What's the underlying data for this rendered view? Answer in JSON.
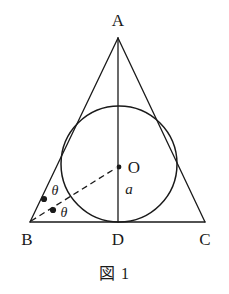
{
  "figure": {
    "caption": "図 1",
    "background_color": "#ffffff",
    "stroke_color": "#1a1a1a",
    "width": 229,
    "height": 294
  },
  "labels": {
    "apex": "A",
    "bottom_left": "B",
    "bottom_right": "C",
    "foot": "D",
    "center": "O",
    "radius": "a",
    "angle_upper": "θ",
    "angle_lower": "θ"
  },
  "geometry": {
    "type": "isosceles-triangle-with-inscribed-circle",
    "points": {
      "A": [
        118,
        38
      ],
      "B": [
        30,
        222
      ],
      "C": [
        205,
        222
      ],
      "D": [
        118,
        222
      ],
      "O": [
        119,
        167
      ]
    },
    "incircle": {
      "cx": 119,
      "cy": 164,
      "r": 58,
      "tangent_point": "D"
    },
    "segments": [
      {
        "name": "side-AB",
        "from": "A",
        "to": "B",
        "style": "solid"
      },
      {
        "name": "side-AC",
        "from": "A",
        "to": "C",
        "style": "solid"
      },
      {
        "name": "base-BC",
        "from": "B",
        "to": "C",
        "style": "solid"
      },
      {
        "name": "median-AD",
        "from": "A",
        "to": "D",
        "style": "solid"
      },
      {
        "name": "radius-BO",
        "from": "B",
        "to": "O",
        "style": "dashed"
      }
    ],
    "angle_marks": {
      "count": 2,
      "dots": [
        [
          44,
          199
        ],
        [
          52,
          210
        ]
      ],
      "description": "two equal angles theta at vertex B split by segment BO"
    }
  }
}
